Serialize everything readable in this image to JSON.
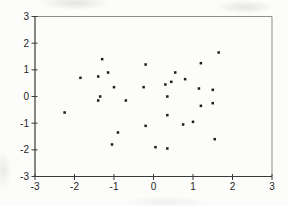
{
  "window": {
    "title": "scatter plot figure"
  },
  "colors": {
    "background": "#fcfcfa",
    "axis": "#3a3a3a",
    "box_border": "#8d8d8d",
    "dot": "#1c1c1c",
    "tick_label": "#1e1e1e"
  },
  "chart_data": {
    "type": "scatter",
    "title": "",
    "xlabel": "",
    "ylabel": "",
    "xlim": [
      -3,
      3
    ],
    "ylim": [
      -3,
      3
    ],
    "x_ticks": [
      "-3",
      "-2",
      "-1",
      "0",
      "1",
      "2",
      "3"
    ],
    "x_tick_values": [
      -3,
      -2,
      -1,
      0,
      1,
      2,
      3
    ],
    "y_ticks": [
      "3",
      "2",
      "1",
      "0",
      "-1",
      "-2",
      "-3"
    ],
    "y_tick_values": [
      3,
      2,
      1,
      0,
      -1,
      -2,
      -3
    ],
    "grid": false,
    "legend_position": "none",
    "marker": "small-black-square",
    "points": [
      {
        "x": -2.25,
        "y": -0.6
      },
      {
        "x": -1.85,
        "y": 0.7
      },
      {
        "x": -1.4,
        "y": 0.75
      },
      {
        "x": -1.3,
        "y": 1.4
      },
      {
        "x": -1.15,
        "y": 0.9
      },
      {
        "x": -1.35,
        "y": 0.0
      },
      {
        "x": -1.4,
        "y": -0.15
      },
      {
        "x": -1.0,
        "y": 0.35
      },
      {
        "x": -1.05,
        "y": -1.8
      },
      {
        "x": -0.9,
        "y": -1.35
      },
      {
        "x": -0.7,
        "y": -0.15
      },
      {
        "x": -0.25,
        "y": 0.35
      },
      {
        "x": -0.2,
        "y": 1.2
      },
      {
        "x": -0.2,
        "y": -1.1
      },
      {
        "x": 0.05,
        "y": -1.9
      },
      {
        "x": 0.3,
        "y": 0.45
      },
      {
        "x": 0.35,
        "y": 0.0
      },
      {
        "x": 0.35,
        "y": -0.7
      },
      {
        "x": 0.35,
        "y": -1.95
      },
      {
        "x": 0.45,
        "y": 0.55
      },
      {
        "x": 0.55,
        "y": 0.9
      },
      {
        "x": 0.8,
        "y": 0.65
      },
      {
        "x": 0.75,
        "y": -1.05
      },
      {
        "x": 1.0,
        "y": -0.95
      },
      {
        "x": 1.15,
        "y": 0.3
      },
      {
        "x": 1.2,
        "y": 1.25
      },
      {
        "x": 1.2,
        "y": -0.35
      },
      {
        "x": 1.5,
        "y": 0.25
      },
      {
        "x": 1.5,
        "y": -0.25
      },
      {
        "x": 1.55,
        "y": -1.6
      },
      {
        "x": 1.65,
        "y": 1.65
      }
    ]
  }
}
